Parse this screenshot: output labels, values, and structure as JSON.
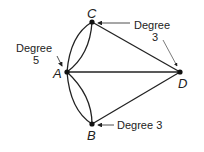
{
  "diagram": {
    "type": "multigraph",
    "vertices": [
      {
        "id": "A",
        "label": "A",
        "degree": 5
      },
      {
        "id": "B",
        "label": "B",
        "degree": 3
      },
      {
        "id": "C",
        "label": "C",
        "degree": 3
      },
      {
        "id": "D",
        "label": "D",
        "degree": 3
      }
    ],
    "edges": [
      {
        "from": "A",
        "to": "C",
        "count": 2
      },
      {
        "from": "A",
        "to": "B",
        "count": 2
      },
      {
        "from": "A",
        "to": "D",
        "count": 1
      },
      {
        "from": "C",
        "to": "D",
        "count": 1
      },
      {
        "from": "B",
        "to": "D",
        "count": 1
      }
    ],
    "annotations": {
      "a_line1": "Degree",
      "a_line2": "5",
      "c_line1": "Degree",
      "c_line2": "3",
      "b_text": "Degree 3"
    }
  }
}
